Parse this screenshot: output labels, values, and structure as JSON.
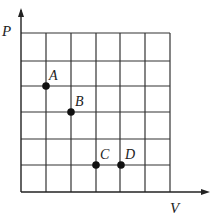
{
  "diagram": {
    "type": "P-V grid diagram",
    "x_axis_label": "V",
    "y_axis_label": "P",
    "grid": {
      "columns": 6,
      "rows": 6
    },
    "points": [
      {
        "label": "A",
        "x": 1,
        "y": 4
      },
      {
        "label": "B",
        "x": 2,
        "y": 3
      },
      {
        "label": "C",
        "x": 3,
        "y": 1
      },
      {
        "label": "D",
        "x": 4,
        "y": 1
      }
    ]
  }
}
